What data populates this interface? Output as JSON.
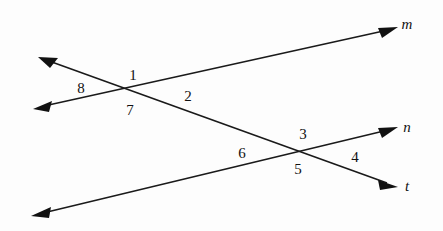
{
  "figure": {
    "background_color": "#fdfdfd",
    "stroke_color": "#1a1a1a"
  },
  "lines": [
    {
      "id": "line-m",
      "label": "m",
      "label_position": {
        "x": 406,
        "y": 25
      },
      "from": {
        "x": 35,
        "y": 108
      },
      "to": {
        "x": 396,
        "y": 28
      },
      "arrow_start": true,
      "arrow_end": true
    },
    {
      "id": "line-t",
      "label": "t",
      "label_position": {
        "x": 406,
        "y": 187
      },
      "from": {
        "x": 40,
        "y": 58
      },
      "to": {
        "x": 396,
        "y": 186
      },
      "arrow_start": true,
      "arrow_end": true
    },
    {
      "id": "line-n",
      "label": "n",
      "label_position": {
        "x": 406,
        "y": 128
      },
      "from": {
        "x": 33,
        "y": 215
      },
      "to": {
        "x": 396,
        "y": 128
      },
      "arrow_start": true,
      "arrow_end": true
    }
  ],
  "intersections": [
    {
      "id": "intersection-upper-left",
      "x": 131,
      "y": 91
    },
    {
      "id": "intersection-lower-right",
      "x": 298,
      "y": 152
    }
  ],
  "angle_labels": [
    {
      "id": "angle-1",
      "text": "1",
      "x": 133,
      "y": 77
    },
    {
      "id": "angle-2",
      "text": "2",
      "x": 188,
      "y": 98
    },
    {
      "id": "angle-3",
      "text": "3",
      "x": 303,
      "y": 136
    },
    {
      "id": "angle-4",
      "text": "4",
      "x": 355,
      "y": 159
    },
    {
      "id": "angle-5",
      "text": "5",
      "x": 298,
      "y": 171
    },
    {
      "id": "angle-6",
      "text": "6",
      "x": 242,
      "y": 155
    },
    {
      "id": "angle-7",
      "text": "7",
      "x": 130,
      "y": 112
    },
    {
      "id": "angle-8",
      "text": "8",
      "x": 81,
      "y": 90
    }
  ],
  "line_labels": [
    {
      "id": "label-m",
      "text": "m"
    },
    {
      "id": "label-n",
      "text": "n"
    },
    {
      "id": "label-t",
      "text": "t"
    }
  ]
}
